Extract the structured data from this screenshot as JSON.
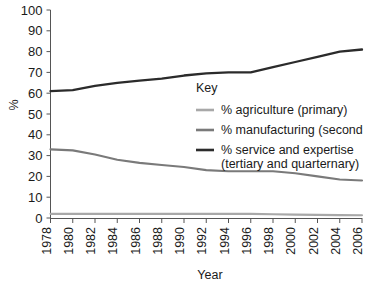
{
  "chart_data": {
    "type": "line",
    "title": "",
    "xlabel": "Year",
    "ylabel": "%",
    "xlim": [
      1978,
      2006
    ],
    "ylim": [
      0,
      100
    ],
    "grid": false,
    "legend_position": "center-right",
    "legend_title": "Key",
    "categories": [
      1978,
      1980,
      1982,
      1984,
      1986,
      1988,
      1990,
      1992,
      1994,
      1996,
      1998,
      2000,
      2002,
      2004,
      2006
    ],
    "x_tick_labels": [
      "1978",
      "1980",
      "1982",
      "1984",
      "1986",
      "1988",
      "1990",
      "1992",
      "1994",
      "1996",
      "1998",
      "2000",
      "2002",
      "2004",
      "2006"
    ],
    "y_tick_labels": [
      "0",
      "10",
      "20",
      "30",
      "40",
      "50",
      "60",
      "70",
      "80",
      "90",
      "100"
    ],
    "y_ticks": [
      0,
      10,
      20,
      30,
      40,
      50,
      60,
      70,
      80,
      90,
      100
    ],
    "series": [
      {
        "name": "% agriculture (primary)",
        "color": "#a8a8a8",
        "values": [
          2.0,
          2.0,
          2.0,
          2.0,
          2.0,
          2.0,
          2.0,
          2.0,
          2.0,
          2.0,
          1.8,
          1.6,
          1.5,
          1.4,
          1.3
        ]
      },
      {
        "name": "% manufacturing (secondary)",
        "color": "#7a7a7a",
        "values": [
          33.0,
          32.5,
          30.5,
          28.0,
          26.5,
          25.5,
          24.5,
          23.0,
          22.5,
          22.5,
          22.5,
          21.5,
          20.0,
          18.5,
          18.0
        ]
      },
      {
        "name": "% service and expertise (tertiary and quarternary)",
        "color": "#2b2b2b",
        "values": [
          61.0,
          61.5,
          63.5,
          65.0,
          66.0,
          67.0,
          68.5,
          69.5,
          70.0,
          70.0,
          72.5,
          75.0,
          77.5,
          80.0,
          81.0
        ]
      }
    ]
  },
  "legend": {
    "title": "Key",
    "entries": [
      {
        "label": "% agriculture (primary)",
        "color": "#a8a8a8"
      },
      {
        "label": "% manufacturing (second",
        "color": "#7a7a7a"
      },
      {
        "label": "% service and expertise",
        "label2": "(tertiary and quarternary)",
        "color": "#2b2b2b"
      }
    ]
  },
  "axes": {
    "x_title": "Year",
    "y_title": "%"
  }
}
